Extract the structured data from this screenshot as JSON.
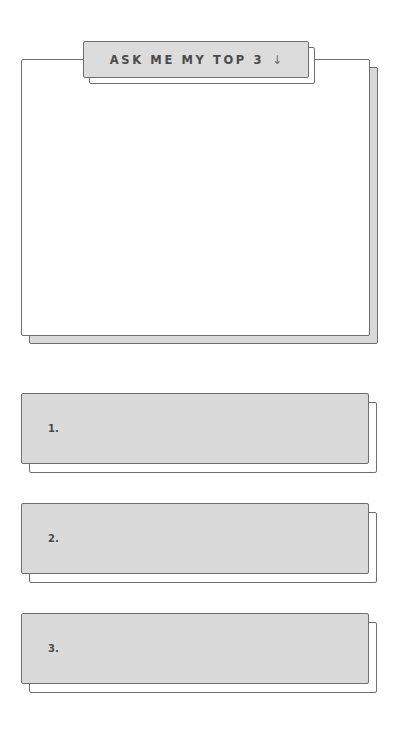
{
  "header": {
    "title": "ASK ME MY TOP 3",
    "arrow_icon": "arrow-down-icon",
    "arrow_glyph": "↓"
  },
  "main_card": {
    "content": ""
  },
  "ranks": [
    {
      "label": "1.",
      "value": ""
    },
    {
      "label": "2.",
      "value": ""
    },
    {
      "label": "3.",
      "value": ""
    }
  ],
  "colors": {
    "border": "#6e6e6e",
    "fill_gray": "#dadada",
    "background": "#ffffff",
    "text": "#4a4a4a"
  }
}
